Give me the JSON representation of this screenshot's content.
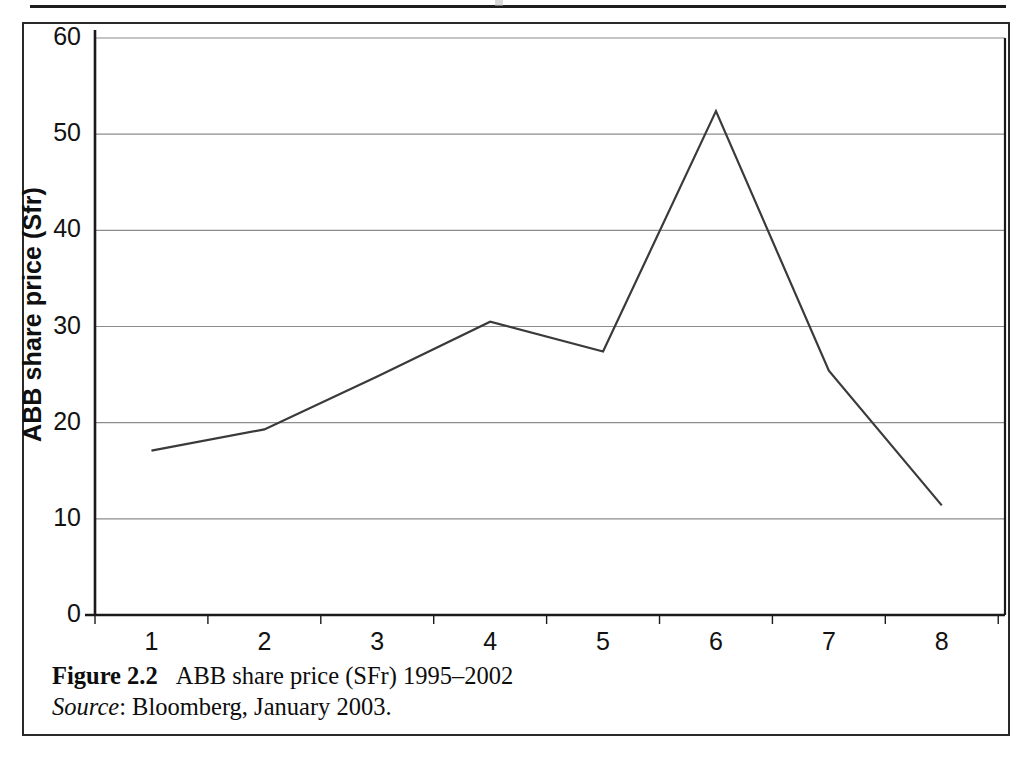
{
  "figure": {
    "caption_label": "Figure 2.2",
    "caption_text": "ABB share price (SFr) 1995–2002",
    "source_label": "Source",
    "source_text": ": Bloomberg, January 2003."
  },
  "colors": {
    "line": "#3a3a3a",
    "gridline": "#8c8c8c",
    "axis": "#1a1a1a",
    "text": "#111111",
    "frame": "#2a2a2a",
    "background": "#ffffff"
  },
  "chart_data": {
    "type": "line",
    "title": "",
    "xlabel": "",
    "ylabel": "ABB share price (Sfr)",
    "categories": [
      "1",
      "2",
      "3",
      "4",
      "5",
      "6",
      "7",
      "8"
    ],
    "values": [
      17.1,
      19.3,
      24.8,
      30.5,
      27.4,
      52.4,
      25.4,
      11.4
    ],
    "series": [
      {
        "name": "ABB share price",
        "values": [
          17.1,
          19.3,
          24.8,
          30.5,
          27.4,
          52.4,
          25.4,
          11.4
        ]
      }
    ],
    "ylim": [
      0,
      60
    ],
    "yticks": [
      0,
      10,
      20,
      30,
      40,
      50,
      60
    ],
    "ytick_labels": [
      "0",
      "10",
      "20",
      "30",
      "40",
      "50",
      "60"
    ],
    "xtick_labels": [
      "1",
      "2",
      "3",
      "4",
      "5",
      "6",
      "7",
      "8"
    ],
    "grid": true,
    "grid_axis": "y",
    "legend": false,
    "legend_position": "none",
    "markers": false
  }
}
